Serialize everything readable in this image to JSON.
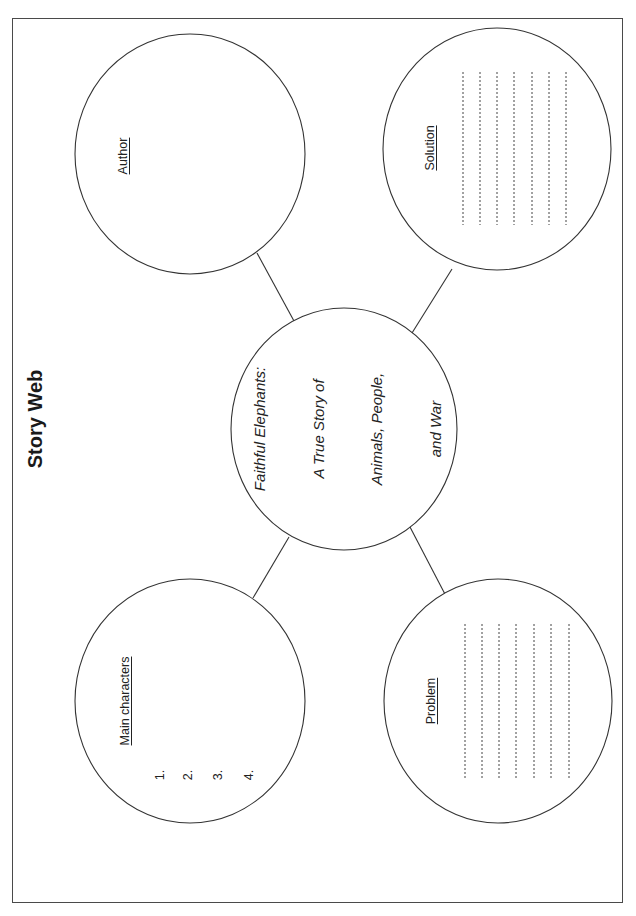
{
  "page": {
    "title": "Story Web"
  },
  "center": {
    "title_lines": [
      "Faithful Elephants:",
      "A True Story of",
      "Animals, People,",
      "and War"
    ]
  },
  "nodes": {
    "author": {
      "label": "Author"
    },
    "solution": {
      "label": "Solution",
      "writing_lines": 7
    },
    "main_characters": {
      "label": "Main characters",
      "items": [
        "1.",
        "2.",
        "3.",
        "4."
      ]
    },
    "problem": {
      "label": "Problem",
      "writing_lines": 7
    }
  },
  "colors": {
    "stroke": "#333333",
    "text": "#222222",
    "background": "#ffffff"
  }
}
